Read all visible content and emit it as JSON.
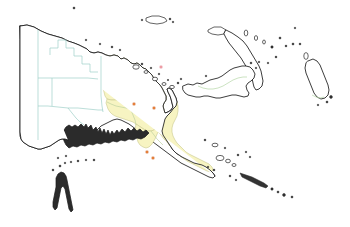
{
  "map": {
    "title": "Papua New Guinea and western New Guinea",
    "background_color": "#ffffff",
    "highlight_color": "#f7f4c2",
    "coastline_color": "#1a1a1a",
    "indonesia_border_color": "#9fd0c8",
    "png_border_color": "#b6d7a8",
    "city_marker_color": "#e8823c",
    "secondary_marker_color": "#f0a0a8",
    "width": 350,
    "height": 227
  },
  "regions": [
    {
      "name": "western-new-guinea",
      "label": "Western New Guinea (Indonesia)",
      "fill": "#ffffff",
      "highlighted": false
    },
    {
      "name": "sandaun-province",
      "label": "Sandaun",
      "fill": "#f7f4c2",
      "highlighted": true
    },
    {
      "name": "east-sepik-province",
      "label": "East Sepik",
      "fill": "#f7f4c2",
      "highlighted": true
    },
    {
      "name": "highlands-provinces",
      "label": "Highlands",
      "fill": "#f7f4c2",
      "highlighted": true
    },
    {
      "name": "gulf-province",
      "label": "Gulf",
      "fill": "#f7f4c2",
      "highlighted": true
    },
    {
      "name": "central-province",
      "label": "Central",
      "fill": "#f7f4c2",
      "highlighted": true
    },
    {
      "name": "milne-bay-province",
      "label": "Milne Bay",
      "fill": "#f7f4c2",
      "highlighted": true
    },
    {
      "name": "new-britain-island",
      "label": "New Britain",
      "fill": "#ffffff",
      "highlighted": false
    },
    {
      "name": "new-ireland-island",
      "label": "New Ireland",
      "fill": "#ffffff",
      "highlighted": false
    },
    {
      "name": "bougainville-island",
      "label": "Bougainville",
      "fill": "#ffffff",
      "highlighted": false
    },
    {
      "name": "cape-york-australia",
      "label": "Cape York Peninsula",
      "fill": "#ffffff",
      "highlighted": false
    }
  ],
  "markers": [
    {
      "name": "marker-sepik",
      "color": "#e8823c",
      "x": 134,
      "y": 104
    },
    {
      "name": "marker-lae",
      "color": "#e8823c",
      "x": 154,
      "y": 108
    },
    {
      "name": "marker-gulf",
      "color": "#e8823c",
      "x": 147,
      "y": 152
    },
    {
      "name": "marker-port-moresby",
      "color": "#e8823c",
      "x": 153,
      "y": 158
    },
    {
      "name": "marker-north-sea",
      "color": "#f0a0a8",
      "x": 161,
      "y": 67
    }
  ]
}
